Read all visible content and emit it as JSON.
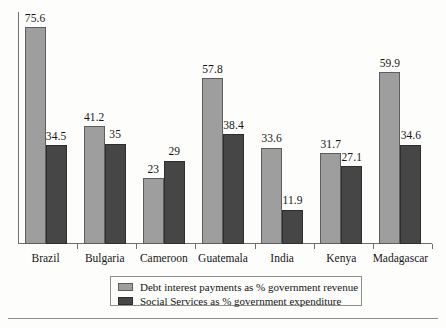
{
  "chart_data": {
    "type": "bar",
    "title": "",
    "subtitle": "",
    "xlabel": "",
    "ylabel": "",
    "grid": false,
    "legend_position": "bottom-center",
    "ylim": [
      0,
      81
    ],
    "axis_visible": {
      "x": true,
      "y": true,
      "y_ticks": false
    },
    "categories": [
      "Brazil",
      "Bulgaria",
      "Cameroon",
      "Guatemala",
      "India",
      "Kenya",
      "Madagascar"
    ],
    "series": [
      {
        "name": "Debt interest payments as % government revenue",
        "color": "#9e9e9e",
        "values": [
          75.6,
          41.2,
          23,
          57.8,
          33.6,
          31.7,
          59.9
        ],
        "labels": [
          "75.6",
          "41.2",
          "23",
          "57.8",
          "33.6",
          "31.7",
          "59.9"
        ]
      },
      {
        "name": "Social Services as % government expenditure",
        "color": "#464646",
        "values": [
          34.5,
          35,
          29,
          38.4,
          11.9,
          27.1,
          34.6
        ],
        "labels": [
          "34.5",
          "35",
          "29",
          "38.4",
          "11.9",
          "27.1",
          "34.6"
        ]
      }
    ]
  },
  "legend": {
    "items": [
      {
        "label": "Debt interest payments as % government revenue",
        "swatch": "light"
      },
      {
        "label": "Social Services as % government expenditure",
        "swatch": "dark"
      }
    ]
  },
  "colors": {
    "series_light": "#9e9e9e",
    "series_dark": "#464646",
    "axis": "#6f6f6f",
    "text": "#161616",
    "background": "#fdfdfb",
    "rule": "#8d8d8d"
  }
}
